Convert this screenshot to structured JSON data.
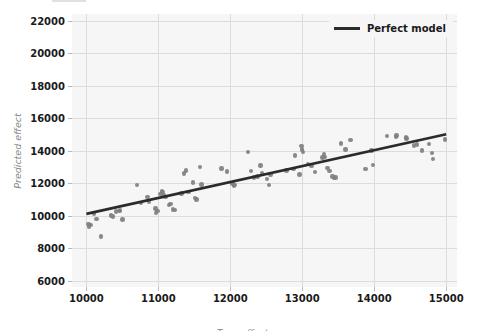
{
  "figure": {
    "width": 485,
    "height": 331,
    "background": "#ffffff",
    "axes_background": "#f6f6f6",
    "grid_color": "#dcdcdc"
  },
  "layout": {
    "plot_left": 72,
    "plot_right": 457,
    "plot_top": 14,
    "plot_bottom": 287
  },
  "legend": {
    "label": "Perfect model",
    "line_color": "#2b2b2b",
    "position": "upper right"
  },
  "chart_data": {
    "type": "scatter",
    "title": "",
    "xlabel": "True effect",
    "ylabel": "Predicted effect",
    "xlim": [
      9800,
      15150
    ],
    "ylim": [
      5600,
      22400
    ],
    "xticks": [
      10000,
      11000,
      12000,
      13000,
      14000,
      15000
    ],
    "yticks": [
      6000,
      8000,
      10000,
      12000,
      14000,
      16000,
      18000,
      20000,
      22000
    ],
    "xtick_labels": [
      "10000",
      "11000",
      "12000",
      "13000",
      "14000",
      "15000"
    ],
    "ytick_labels": [
      "6000",
      "8000",
      "10000",
      "12000",
      "14000",
      "16000",
      "18000",
      "20000",
      "22000"
    ],
    "grid": true,
    "legend_position": "upper right",
    "series": [
      {
        "name": "Perfect model",
        "type": "line",
        "color": "#2b2b2b",
        "linewidth": 2.6,
        "x": [
          10000,
          15000
        ],
        "y": [
          10100,
          15000
        ]
      },
      {
        "name": "predictions",
        "type": "scatter",
        "color": "#7f7f7f",
        "marker_size": 4.4,
        "points": [
          [
            10030,
            9480
          ],
          [
            10040,
            9330
          ],
          [
            10060,
            9420
          ],
          [
            10110,
            10120
          ],
          [
            10140,
            9780
          ],
          [
            10200,
            8700
          ],
          [
            10340,
            10010
          ],
          [
            10370,
            9940
          ],
          [
            10410,
            10250
          ],
          [
            10450,
            10260
          ],
          [
            10470,
            10300
          ],
          [
            10500,
            9760
          ],
          [
            10700,
            11860
          ],
          [
            10760,
            10780
          ],
          [
            10850,
            11150
          ],
          [
            10870,
            10830
          ],
          [
            10960,
            10440
          ],
          [
            10970,
            10170
          ],
          [
            10990,
            10290
          ],
          [
            11030,
            11330
          ],
          [
            11050,
            11510
          ],
          [
            11060,
            11450
          ],
          [
            11080,
            11270
          ],
          [
            11100,
            11140
          ],
          [
            11150,
            10640
          ],
          [
            11170,
            10700
          ],
          [
            11200,
            10370
          ],
          [
            11230,
            10330
          ],
          [
            11320,
            11360
          ],
          [
            11360,
            12580
          ],
          [
            11380,
            12780
          ],
          [
            11420,
            11440
          ],
          [
            11480,
            12030
          ],
          [
            11510,
            11090
          ],
          [
            11530,
            10980
          ],
          [
            11580,
            13000
          ],
          [
            11600,
            11900
          ],
          [
            11880,
            12900
          ],
          [
            11950,
            12710
          ],
          [
            12030,
            11960
          ],
          [
            12050,
            11810
          ],
          [
            12060,
            11880
          ],
          [
            12250,
            13920
          ],
          [
            12290,
            12720
          ],
          [
            12330,
            12340
          ],
          [
            12380,
            12390
          ],
          [
            12420,
            13070
          ],
          [
            12440,
            12630
          ],
          [
            12510,
            12260
          ],
          [
            12540,
            11870
          ],
          [
            12560,
            12520
          ],
          [
            12780,
            12760
          ],
          [
            12880,
            12880
          ],
          [
            12900,
            13690
          ],
          [
            12960,
            12520
          ],
          [
            12990,
            14290
          ],
          [
            13000,
            14070
          ],
          [
            13010,
            13920
          ],
          [
            13080,
            13180
          ],
          [
            13130,
            13060
          ],
          [
            13180,
            12670
          ],
          [
            13280,
            13560
          ],
          [
            13300,
            13780
          ],
          [
            13310,
            13600
          ],
          [
            13350,
            12940
          ],
          [
            13380,
            12750
          ],
          [
            13420,
            12400
          ],
          [
            13440,
            12290
          ],
          [
            13460,
            12330
          ],
          [
            13540,
            14420
          ],
          [
            13600,
            14060
          ],
          [
            13670,
            14630
          ],
          [
            13880,
            12880
          ],
          [
            13960,
            14000
          ],
          [
            13980,
            13100
          ],
          [
            14180,
            14890
          ],
          [
            14300,
            14840
          ],
          [
            14310,
            14930
          ],
          [
            14440,
            14800
          ],
          [
            14450,
            14750
          ],
          [
            14550,
            14310
          ],
          [
            14590,
            14380
          ],
          [
            14660,
            14010
          ],
          [
            14760,
            14390
          ],
          [
            14800,
            13860
          ],
          [
            14820,
            13480
          ],
          [
            14980,
            14680
          ]
        ]
      }
    ]
  }
}
